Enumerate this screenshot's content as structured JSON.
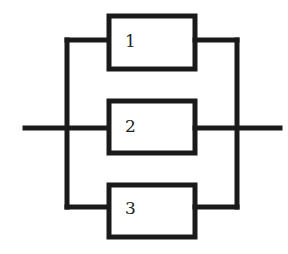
{
  "diagram": {
    "type": "parallel-system",
    "blocks": [
      {
        "id": "1",
        "label": "1"
      },
      {
        "id": "2",
        "label": "2"
      },
      {
        "id": "3",
        "label": "3"
      }
    ],
    "colors": {
      "stroke": "#1a1a1a",
      "background": "#ffffff"
    }
  }
}
